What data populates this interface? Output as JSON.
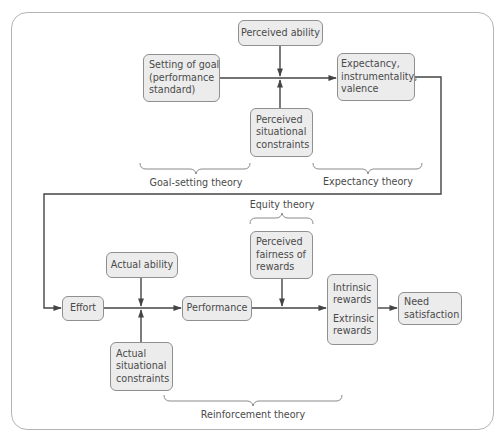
{
  "diagram": {
    "title": "",
    "colors": {
      "box_fill": "#ececec",
      "box_border": "#8f8f8f",
      "line": "#444444",
      "text": "#4a4a4a",
      "frame": "#b4b4b4"
    },
    "nodes": {
      "perceived_ability": {
        "lines": [
          "Perceived ability"
        ]
      },
      "setting_of_goal": {
        "lines": [
          "Setting of goal",
          "(performance",
          "standard)"
        ]
      },
      "perceived_constraints": {
        "lines": [
          "Perceived",
          "situational",
          "constraints"
        ]
      },
      "expectancy": {
        "lines": [
          "Expectancy,",
          "instrumentality,",
          "valence"
        ]
      },
      "effort": {
        "lines": [
          "Effort"
        ]
      },
      "actual_ability": {
        "lines": [
          "Actual ability"
        ]
      },
      "actual_constraints": {
        "lines": [
          "Actual",
          "situational",
          "constraints"
        ]
      },
      "performance": {
        "lines": [
          "Performance"
        ]
      },
      "perceived_fairness": {
        "lines": [
          "Perceived",
          "fairness of",
          "rewards"
        ]
      },
      "rewards": {
        "intrinsic": [
          "Intrinsic",
          "rewards"
        ],
        "extrinsic": [
          "Extrinsic",
          "rewards"
        ]
      },
      "need_satisfaction": {
        "lines": [
          "Need",
          "satisfaction"
        ]
      }
    },
    "theories": {
      "goal_setting": "Goal-setting theory",
      "expectancy": "Expectancy theory",
      "equity": "Equity theory",
      "reinforcement": "Reinforcement theory"
    },
    "edges": [
      {
        "from": "setting_of_goal",
        "to": "expectancy"
      },
      {
        "from": "perceived_ability",
        "to": "setting_of_goal->expectancy",
        "type": "moderator"
      },
      {
        "from": "perceived_constraints",
        "to": "setting_of_goal->expectancy",
        "type": "moderator"
      },
      {
        "from": "expectancy",
        "to": "effort"
      },
      {
        "from": "effort",
        "to": "performance"
      },
      {
        "from": "actual_ability",
        "to": "effort->performance",
        "type": "moderator"
      },
      {
        "from": "actual_constraints",
        "to": "effort->performance",
        "type": "moderator"
      },
      {
        "from": "performance",
        "to": "rewards"
      },
      {
        "from": "perceived_fairness",
        "to": "performance->rewards",
        "type": "moderator"
      },
      {
        "from": "rewards",
        "to": "need_satisfaction"
      }
    ]
  }
}
